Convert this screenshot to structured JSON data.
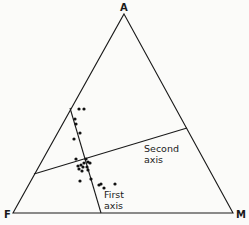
{
  "diagram": {
    "type": "ternary",
    "vertices": {
      "top": {
        "label": "A",
        "x": 124,
        "y": 14
      },
      "left": {
        "label": "F",
        "x": 13,
        "y": 213
      },
      "right": {
        "label": "M",
        "x": 233,
        "y": 213
      }
    },
    "axes": [
      {
        "label_line1": "First",
        "label_line2": "axis",
        "x1": 70,
        "y1": 108,
        "x2": 101,
        "y2": 213
      },
      {
        "label_line1": "Second",
        "label_line2": "axis",
        "x1": 34,
        "y1": 174,
        "x2": 187,
        "y2": 128
      }
    ],
    "colors": {
      "line": "#1a1a1a",
      "point": "#111111",
      "background": "#fbfbf9"
    }
  },
  "chart_data": {
    "type": "scatter",
    "title": "",
    "points": [
      {
        "x": 79,
        "y": 109
      },
      {
        "x": 84,
        "y": 109
      },
      {
        "x": 75,
        "y": 119
      },
      {
        "x": 76,
        "y": 124
      },
      {
        "x": 80,
        "y": 133
      },
      {
        "x": 74,
        "y": 139
      },
      {
        "x": 76,
        "y": 159
      },
      {
        "x": 86,
        "y": 159
      },
      {
        "x": 84,
        "y": 163
      },
      {
        "x": 88,
        "y": 162
      },
      {
        "x": 90,
        "y": 163
      },
      {
        "x": 78,
        "y": 166
      },
      {
        "x": 81,
        "y": 165
      },
      {
        "x": 83,
        "y": 167
      },
      {
        "x": 87,
        "y": 167
      },
      {
        "x": 79,
        "y": 169
      },
      {
        "x": 82,
        "y": 171
      },
      {
        "x": 88,
        "y": 170
      },
      {
        "x": 80,
        "y": 181
      },
      {
        "x": 91,
        "y": 179
      },
      {
        "x": 99,
        "y": 185
      },
      {
        "x": 101,
        "y": 184
      },
      {
        "x": 104,
        "y": 188
      },
      {
        "x": 115,
        "y": 184
      }
    ]
  }
}
